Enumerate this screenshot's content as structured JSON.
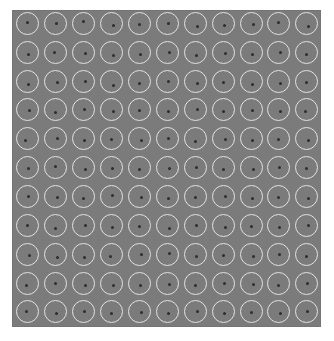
{
  "stimulus": {
    "grid": {
      "rows": 11,
      "cols": 11
    },
    "field": {
      "background": "#7b7b7b"
    },
    "ring_color": "#e2e2e2",
    "dot_color": "#2e2e2e",
    "col_centers": [
      28,
      56,
      84,
      112,
      140,
      168,
      196,
      224,
      252,
      279,
      307
    ],
    "row_centers": [
      24,
      53,
      82,
      110,
      139,
      168,
      197,
      226,
      255,
      284,
      312
    ],
    "dot_offsets": [
      [
        [
          -1,
          -2
        ],
        [
          0,
          -1
        ],
        [
          -1,
          -3
        ],
        [
          1,
          1
        ],
        [
          -1,
          0
        ],
        [
          0,
          -1
        ],
        [
          1,
          2
        ],
        [
          0,
          1
        ],
        [
          1,
          0
        ],
        [
          -1,
          -2
        ],
        [
          1,
          2
        ]
      ],
      [
        [
          0,
          1
        ],
        [
          -2,
          -1
        ],
        [
          1,
          0
        ],
        [
          1,
          2
        ],
        [
          0,
          1
        ],
        [
          1,
          -1
        ],
        [
          0,
          2
        ],
        [
          1,
          0
        ],
        [
          0,
          1
        ],
        [
          1,
          -1
        ],
        [
          -1,
          1
        ]
      ],
      [
        [
          0,
          2
        ],
        [
          1,
          0
        ],
        [
          1,
          -1
        ],
        [
          1,
          3
        ],
        [
          -1,
          1
        ],
        [
          0,
          -1
        ],
        [
          1,
          1
        ],
        [
          -1,
          0
        ],
        [
          0,
          2
        ],
        [
          1,
          1
        ],
        [
          -1,
          0
        ]
      ],
      [
        [
          1,
          0
        ],
        [
          -1,
          2
        ],
        [
          0,
          -1
        ],
        [
          1,
          1
        ],
        [
          -1,
          0
        ],
        [
          0,
          1
        ],
        [
          1,
          -1
        ],
        [
          -1,
          1
        ],
        [
          0,
          0
        ],
        [
          1,
          1
        ],
        [
          -2,
          1
        ]
      ],
      [
        [
          -3,
          1
        ],
        [
          1,
          -1
        ],
        [
          0,
          1
        ],
        [
          -1,
          0
        ],
        [
          1,
          1
        ],
        [
          0,
          -1
        ],
        [
          -1,
          2
        ],
        [
          1,
          0
        ],
        [
          0,
          1
        ],
        [
          -1,
          0
        ],
        [
          1,
          1
        ]
      ],
      [
        [
          0,
          0
        ],
        [
          -1,
          -2
        ],
        [
          1,
          1
        ],
        [
          0,
          0
        ],
        [
          -1,
          1
        ],
        [
          1,
          0
        ],
        [
          0,
          -1
        ],
        [
          -1,
          1
        ],
        [
          1,
          1
        ],
        [
          0,
          -1
        ],
        [
          -1,
          0
        ]
      ],
      [
        [
          0,
          -1
        ],
        [
          1,
          0
        ],
        [
          -1,
          1
        ],
        [
          0,
          -2
        ],
        [
          1,
          0
        ],
        [
          0,
          1
        ],
        [
          -1,
          0
        ],
        [
          1,
          -1
        ],
        [
          0,
          1
        ],
        [
          -1,
          0
        ],
        [
          1,
          1
        ]
      ],
      [
        [
          -1,
          -1
        ],
        [
          -1,
          2
        ],
        [
          1,
          -1
        ],
        [
          0,
          1
        ],
        [
          -1,
          0
        ],
        [
          1,
          2
        ],
        [
          0,
          -1
        ],
        [
          1,
          1
        ],
        [
          -1,
          0
        ],
        [
          0,
          1
        ],
        [
          1,
          -1
        ]
      ],
      [
        [
          1,
          0
        ],
        [
          1,
          2
        ],
        [
          0,
          2
        ],
        [
          -2,
          1
        ],
        [
          1,
          -1
        ],
        [
          1,
          -2
        ],
        [
          0,
          1
        ],
        [
          -1,
          0
        ],
        [
          1,
          1
        ],
        [
          0,
          -1
        ],
        [
          -1,
          1
        ]
      ],
      [
        [
          -2,
          1
        ],
        [
          -1,
          -1
        ],
        [
          1,
          1
        ],
        [
          1,
          1
        ],
        [
          0,
          1
        ],
        [
          1,
          0
        ],
        [
          -1,
          1
        ],
        [
          0,
          -1
        ],
        [
          1,
          0
        ],
        [
          -1,
          1
        ],
        [
          0,
          -1
        ]
      ],
      [
        [
          -2,
          -1
        ],
        [
          0,
          1
        ],
        [
          0,
          -1
        ],
        [
          -1,
          1
        ],
        [
          1,
          0
        ],
        [
          0,
          1
        ],
        [
          1,
          -1
        ],
        [
          0,
          1
        ],
        [
          -1,
          0
        ],
        [
          1,
          1
        ],
        [
          0,
          -1
        ]
      ]
    ]
  }
}
